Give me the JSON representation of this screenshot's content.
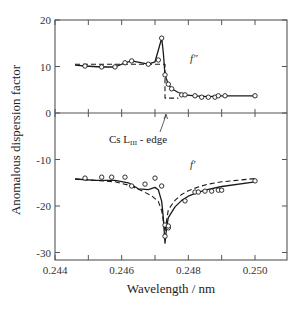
{
  "chart_data": {
    "type": "line",
    "title": "",
    "xlabel": "Wavelength / nm",
    "ylabel": "Anomalous dispersion factor",
    "xlim": [
      0.244,
      0.251
    ],
    "ylim": [
      -32,
      20
    ],
    "x_ticks": [
      0.244,
      0.245,
      0.246,
      0.247,
      0.248,
      0.249,
      0.25
    ],
    "x_tick_labels": [
      "0.244",
      "",
      "0.246",
      "",
      "0.248",
      "",
      "0.250"
    ],
    "y_ticks": [
      20,
      10,
      0,
      -10,
      -20,
      -30
    ],
    "y_tick_labels": [
      "20",
      "10",
      "0",
      "-10",
      "-20",
      "-30"
    ],
    "grid": false,
    "zero_line": true,
    "annotations": [
      {
        "text": "Cs  L",
        "subscript": "III",
        "suffix": " - edge",
        "x": 0.2473,
        "y": 0,
        "arrow": true
      },
      {
        "text": "f″",
        "x": 0.2484,
        "y": 12
      },
      {
        "text": "f′",
        "x": 0.2484,
        "y": -10.5
      }
    ],
    "series": [
      {
        "name": "f'' measured",
        "style": "open-circles",
        "x": [
          0.2449,
          0.2454,
          0.2458,
          0.2461,
          0.2463,
          0.2468,
          0.2471,
          0.2472,
          0.2473,
          0.2474,
          0.2475,
          0.2478,
          0.2479,
          0.2482,
          0.2484,
          0.2486,
          0.2488,
          0.2489,
          0.2491,
          0.25
        ],
        "values": [
          10.1,
          9.9,
          9.9,
          10.8,
          11.2,
          10.5,
          11.4,
          16.1,
          8.2,
          6.2,
          5.2,
          3.9,
          3.9,
          3.7,
          3.4,
          3.4,
          3.4,
          3.7,
          3.7,
          3.7
        ]
      },
      {
        "name": "f'' fit (solid)",
        "style": "solid",
        "x": [
          0.2446,
          0.2449,
          0.2454,
          0.2458,
          0.2461,
          0.2463,
          0.2468,
          0.247,
          0.2471,
          0.2472,
          0.24725,
          0.2473,
          0.2474,
          0.2475,
          0.2477,
          0.2479,
          0.2482,
          0.2486,
          0.249,
          0.25
        ],
        "values": [
          10.3,
          10.1,
          9.9,
          9.9,
          10.8,
          11.2,
          10.5,
          11.0,
          13.5,
          16.1,
          13.0,
          8.2,
          6.2,
          5.2,
          4.4,
          3.9,
          3.7,
          3.5,
          3.7,
          3.7
        ]
      },
      {
        "name": "f'' theory (dashed)",
        "style": "dashed",
        "x": [
          0.2446,
          0.2473,
          0.2473,
          0.2477
        ],
        "values": [
          10.5,
          10.5,
          3.2,
          3.2
        ]
      },
      {
        "name": "f' measured",
        "style": "open-circles",
        "x": [
          0.2449,
          0.2454,
          0.2457,
          0.2461,
          0.2463,
          0.2467,
          0.247,
          0.2472,
          0.2473,
          0.2474,
          0.2474,
          0.2473,
          0.2479,
          0.2482,
          0.2483,
          0.2485,
          0.2487,
          0.2489,
          0.249,
          0.25
        ],
        "values": [
          -14.0,
          -13.8,
          -13.8,
          -13.8,
          -15.7,
          -15.3,
          -14.0,
          -15.7,
          -24.1,
          -24.7,
          -24.3,
          -26.5,
          -18.9,
          -17.0,
          -17.0,
          -16.8,
          -16.8,
          -16.6,
          -16.6,
          -14.6
        ]
      },
      {
        "name": "f' fit (solid)",
        "style": "solid",
        "x": [
          0.2446,
          0.2452,
          0.2458,
          0.2462,
          0.2465,
          0.2468,
          0.247,
          0.2471,
          0.2472,
          0.24725,
          0.2473,
          0.24735,
          0.2474,
          0.2476,
          0.2478,
          0.248,
          0.2483,
          0.2486,
          0.249,
          0.25
        ],
        "values": [
          -14.2,
          -14.5,
          -14.5,
          -15.0,
          -16.3,
          -16.5,
          -16.0,
          -16.5,
          -19.0,
          -22.5,
          -28.0,
          -24.5,
          -22.5,
          -20.2,
          -18.8,
          -17.9,
          -17.0,
          -16.4,
          -15.8,
          -14.8
        ]
      },
      {
        "name": "f' theory (dashed)",
        "style": "dashed",
        "x": [
          0.2446,
          0.2452,
          0.2458,
          0.2462,
          0.2466,
          0.2469,
          0.2471,
          0.2472,
          0.2473,
          0.24735,
          0.2474,
          0.2476,
          0.2478,
          0.248,
          0.2483,
          0.2486,
          0.249,
          0.25
        ],
        "values": [
          -14.2,
          -14.5,
          -14.8,
          -15.5,
          -16.7,
          -17.8,
          -19.0,
          -21.0,
          -25.5,
          -23.0,
          -20.8,
          -18.8,
          -17.5,
          -16.7,
          -15.9,
          -15.3,
          -14.8,
          -14.1
        ]
      }
    ]
  },
  "labels": {
    "xlabel": "Wavelength / nm",
    "ylabel": "Anomalous dispersion factor",
    "edge_label_main": "Cs  L",
    "edge_label_sub": "III",
    "edge_label_suffix": " - edge",
    "f2_label": "f″",
    "f1_label": "f′"
  },
  "colors": {
    "axis": "#555555",
    "line": "#1a1a1a",
    "marker_fill": "#ffffff",
    "text": "#333333"
  }
}
